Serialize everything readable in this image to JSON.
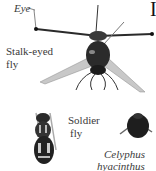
{
  "figure": {
    "partial_letter": "I",
    "labels": {
      "eye": "Eye",
      "stalk_eyed_line1": "Stalk-eyed",
      "stalk_eyed_line2": "fly",
      "soldier_line1": "Soldier",
      "soldier_line2": "fly",
      "celyphus_line1": "Celyphus",
      "celyphus_line2": "hyacinthus"
    },
    "colors": {
      "text": "#3a3a3a",
      "insect_dark": "#1e1e1e",
      "insect_mid": "#555555",
      "wing": "#bdbdbd"
    }
  }
}
